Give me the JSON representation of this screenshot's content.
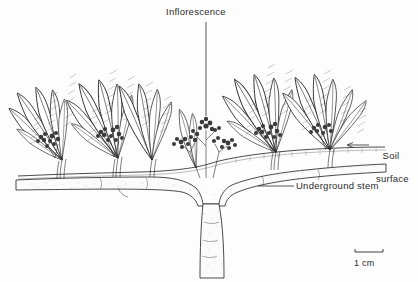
{
  "figure": {
    "type": "botanical-line-illustration",
    "background_color": "#fdfdfd",
    "ink_color": "#2b2b2b"
  },
  "labels": {
    "inflorescence": "Inflorescence",
    "soil_surface_line1": "Soil",
    "soil_surface_line2": "surface",
    "underground_stem": "Underground stem"
  },
  "scale_bar": {
    "label": "1 cm",
    "length_px": 28
  },
  "leader_lines": {
    "inflorescence": "vertical line from label down to inflorescence tip",
    "soil_surface": "horizontal line with left-pointing arrow to soil line",
    "underground_stem": "horizontal line to rhizome"
  },
  "plant_parts": {
    "rosette_count": 5,
    "leaf_shape": "lanceolate",
    "venation": "herringbone pinnate",
    "inflorescence_count": 5,
    "taproot": "single thick vertical root descending from rhizome junction",
    "rhizome": "horizontal underground stem running full width just below soil line"
  }
}
